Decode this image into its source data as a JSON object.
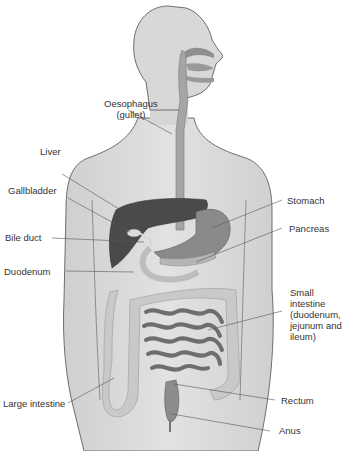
{
  "diagram": {
    "type": "anatomical-illustration",
    "labels": [
      {
        "id": "oesophagus",
        "lines": [
          "Oesophagus",
          "(gullet)"
        ]
      },
      {
        "id": "liver",
        "lines": [
          "Liver"
        ]
      },
      {
        "id": "gallbladder",
        "lines": [
          "Gallbladder"
        ]
      },
      {
        "id": "bile-duct",
        "lines": [
          "Bile duct"
        ]
      },
      {
        "id": "duodenum",
        "lines": [
          "Duodenum"
        ]
      },
      {
        "id": "stomach",
        "lines": [
          "Stomach"
        ]
      },
      {
        "id": "pancreas",
        "lines": [
          "Pancreas"
        ]
      },
      {
        "id": "small-intestine",
        "lines": [
          "Small",
          "intestine",
          "(duodenum,",
          "jejunum and",
          "ileum)"
        ]
      },
      {
        "id": "large-intestine",
        "lines": [
          "Large intestine"
        ]
      },
      {
        "id": "rectum",
        "lines": [
          "Rectum"
        ]
      },
      {
        "id": "anus",
        "lines": [
          "Anus"
        ]
      }
    ]
  },
  "colors": {
    "body_fill": "#d9d9d9",
    "body_outline": "#6e6e6e",
    "tract": "#9a9a9a",
    "liver": "#4a4a4a",
    "intestine": "#c8c8c8",
    "small_intestine": "#7a7a7a",
    "leader": "#555555",
    "text": "#333333"
  }
}
